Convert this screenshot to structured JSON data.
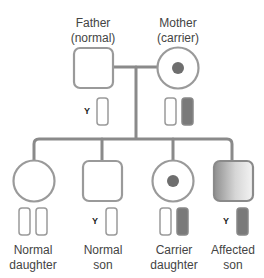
{
  "colors": {
    "line": "#8a8a8a",
    "affected": "#7a7a7a",
    "dot": "#6e6e6e",
    "outline": "#9a9a9a"
  },
  "parents": [
    {
      "id": "father",
      "label_line1": "Father",
      "label_line2": "(normal)",
      "shape": "square",
      "status": "normal",
      "chromosomes": [
        "Y",
        "X-normal"
      ],
      "y_label": "Y"
    },
    {
      "id": "mother",
      "label_line1": "Mother",
      "label_line2": "(carrier)",
      "shape": "circle",
      "status": "carrier",
      "chromosomes": [
        "X-normal",
        "X-affected"
      ]
    }
  ],
  "children": [
    {
      "id": "normal-daughter",
      "label_line1": "Normal",
      "label_line2": "daughter",
      "shape": "circle",
      "status": "normal",
      "chromosomes": [
        "X-normal",
        "X-normal"
      ]
    },
    {
      "id": "normal-son",
      "label_line1": "Normal",
      "label_line2": "son",
      "shape": "square",
      "status": "normal",
      "chromosomes": [
        "Y",
        "X-normal"
      ],
      "y_label": "Y"
    },
    {
      "id": "carrier-daughter",
      "label_line1": "Carrier",
      "label_line2": "daughter",
      "shape": "circle",
      "status": "carrier",
      "chromosomes": [
        "X-normal",
        "X-affected"
      ]
    },
    {
      "id": "affected-son",
      "label_line1": "Affected",
      "label_line2": "son",
      "shape": "square",
      "status": "affected",
      "chromosomes": [
        "Y",
        "X-affected"
      ],
      "y_label": "Y"
    }
  ]
}
